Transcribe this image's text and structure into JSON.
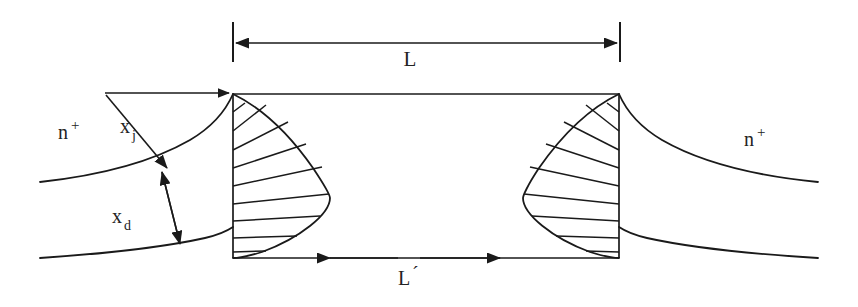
{
  "figure": {
    "background_color": "#ffffff",
    "line_color": "#1a1a1a",
    "width": 858,
    "height": 307
  },
  "labels": {
    "dimension_L": "L",
    "dimension_L_prime": "L",
    "dimension_L_prime_mark": "´",
    "junction_depth": "x",
    "junction_depth_subscript": "j",
    "depletion_width": "x",
    "depletion_width_subscript": "d",
    "region_left": "n",
    "region_left_superscript": "+",
    "region_right": "n",
    "region_right_superscript": "+"
  },
  "geometry": {
    "channel_top_y": 94,
    "channel_bottom_y": 258,
    "left_gate_x": 233,
    "right_gate_x": 619,
    "left_edge_x": 40,
    "right_edge_x": 818,
    "junction_curve_left_y": 182,
    "depletion_curve_left_y": 258,
    "dimension_L_y": 43,
    "dimension_L_tick_left_x": 233,
    "dimension_L_tick_right_x": 620,
    "dimension_L_prime_y": 258,
    "hatch_count_left": 9,
    "hatch_count_right": 9,
    "left_bulge_max_x": 330,
    "left_bulge_y": 198,
    "right_bulge_min_x": 523,
    "right_bulge_y": 195
  },
  "label_positions": {
    "L": {
      "x": 410,
      "y": 66
    },
    "L_prime": {
      "x": 404,
      "y": 285
    },
    "xj": {
      "x": 128,
      "y": 131
    },
    "xd": {
      "x": 120,
      "y": 221
    },
    "n_left": {
      "x": 62,
      "y": 137
    },
    "n_right": {
      "x": 748,
      "y": 145
    }
  }
}
